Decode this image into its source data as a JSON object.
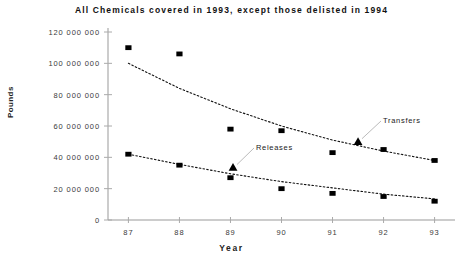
{
  "chart_data": {
    "type": "scatter",
    "title": "All Chemicals covered in 1993, except those delisted in 1994",
    "xlabel": "Year",
    "ylabel": "Pounds",
    "categories": [
      "87",
      "88",
      "89",
      "90",
      "91",
      "92",
      "93"
    ],
    "x": [
      87,
      88,
      89,
      90,
      91,
      92,
      93
    ],
    "xlim": [
      86.6,
      93.4
    ],
    "ylim": [
      0,
      120000000
    ],
    "ytick_labels": [
      "120 000 000",
      "100 000 000",
      "80 000 000",
      "60 000 000",
      "40 000 000",
      "20 000 000",
      "0"
    ],
    "ytick_values": [
      120000000,
      100000000,
      80000000,
      60000000,
      40000000,
      20000000,
      0
    ],
    "grid": false,
    "legend_position": "inline-annotations",
    "series": [
      {
        "name": "Transfers",
        "marker": "square",
        "color": "#000000",
        "values": [
          110000000,
          106000000,
          58000000,
          57000000,
          43000000,
          45000000,
          38000000
        ],
        "trendline": {
          "style": "dotted",
          "type": "exponential",
          "points": [
            [
              87,
              100000000
            ],
            [
              88,
              84000000
            ],
            [
              89,
              71000000
            ],
            [
              90,
              60000000
            ],
            [
              91,
              51000000
            ],
            [
              92,
              44000000
            ],
            [
              93,
              38000000
            ]
          ]
        },
        "annotation": {
          "label": "Transfers",
          "marker": "triangle",
          "marker_x": 91.5,
          "marker_y": 50000000
        }
      },
      {
        "name": "Releases",
        "marker": "square",
        "color": "#000000",
        "values": [
          42000000,
          35000000,
          27000000,
          20000000,
          17000000,
          15000000,
          12000000
        ],
        "trendline": {
          "style": "dotted",
          "type": "exponential",
          "points": [
            [
              87,
              42000000
            ],
            [
              88,
              35500000
            ],
            [
              89,
              29500000
            ],
            [
              90,
              24500000
            ],
            [
              91,
              20500000
            ],
            [
              92,
              16500000
            ],
            [
              93,
              13500000
            ]
          ]
        },
        "annotation": {
          "label": "Releases",
          "marker": "triangle",
          "marker_x": 89.05,
          "marker_y": 33500000
        }
      }
    ]
  }
}
